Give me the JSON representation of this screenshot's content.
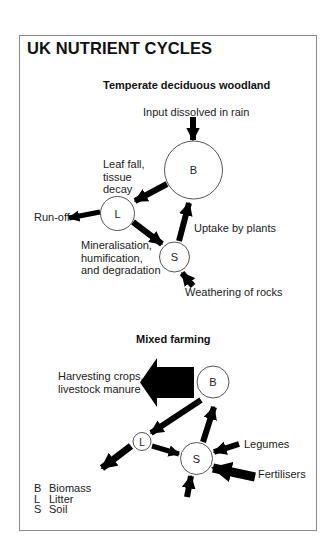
{
  "title": "UK NUTRIENT CYCLES",
  "woodland": {
    "heading": "Temperate deciduous woodland",
    "nodes": {
      "B": "B",
      "L": "L",
      "S": "S"
    },
    "labels": {
      "input": "Input dissolved in rain",
      "leaf_fall": [
        "Leaf fall,",
        "tissue",
        "decay"
      ],
      "runoff": "Run-off",
      "uptake": "Uptake by plants",
      "mineralisation": [
        "Mineralisation,",
        "humification,",
        "and degradation"
      ],
      "weathering": "Weathering of rocks"
    }
  },
  "farming": {
    "heading": "Mixed farming",
    "nodes": {
      "B": "B",
      "L": "L",
      "S": "S"
    },
    "labels": {
      "harvest": [
        "Harvesting crops,",
        "livestock manure"
      ],
      "legumes": "Legumes",
      "fertilisers": "Fertilisers"
    }
  },
  "legend": [
    {
      "key": "B",
      "label": "Biomass"
    },
    {
      "key": "L",
      "label": "Litter"
    },
    {
      "key": "S",
      "label": "Soil"
    }
  ],
  "colors": {
    "arrow": "#000000",
    "circle_stroke": "#555555",
    "frame": "#8a8a8a"
  }
}
